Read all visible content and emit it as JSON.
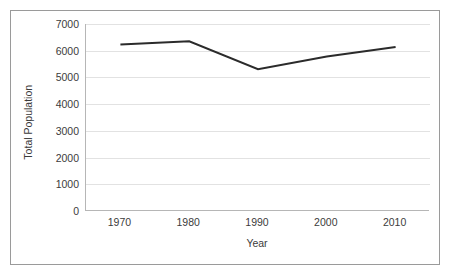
{
  "chart_data": {
    "type": "line",
    "title": "",
    "xlabel": "Year",
    "ylabel": "Total Population",
    "x": [
      1970,
      1980,
      1990,
      2000,
      2010
    ],
    "categories": [
      "1970",
      "1980",
      "1990",
      "2000",
      "2010"
    ],
    "values": [
      6230,
      6350,
      5310,
      5780,
      6140
    ],
    "series": [
      {
        "name": "Total Population",
        "values": [
          6230,
          6350,
          5310,
          5780,
          6140
        ]
      }
    ],
    "xlim": [
      1965,
      2015
    ],
    "ylim": [
      0,
      7000
    ],
    "ytick_labels": [
      "0",
      "1000",
      "2000",
      "3000",
      "4000",
      "5000",
      "6000",
      "7000"
    ],
    "ytick_values": [
      0,
      1000,
      2000,
      3000,
      4000,
      5000,
      6000,
      7000
    ],
    "xtick_labels": [
      "1970",
      "1980",
      "1990",
      "2000",
      "2010"
    ],
    "grid": "horizontal",
    "legend": "none",
    "line_color": "#2b2b2b",
    "gridline_color": "#e2e2e2",
    "axis_color": "#b6b6b6",
    "border_color": "#9a9a9a",
    "background": "#ffffff"
  }
}
